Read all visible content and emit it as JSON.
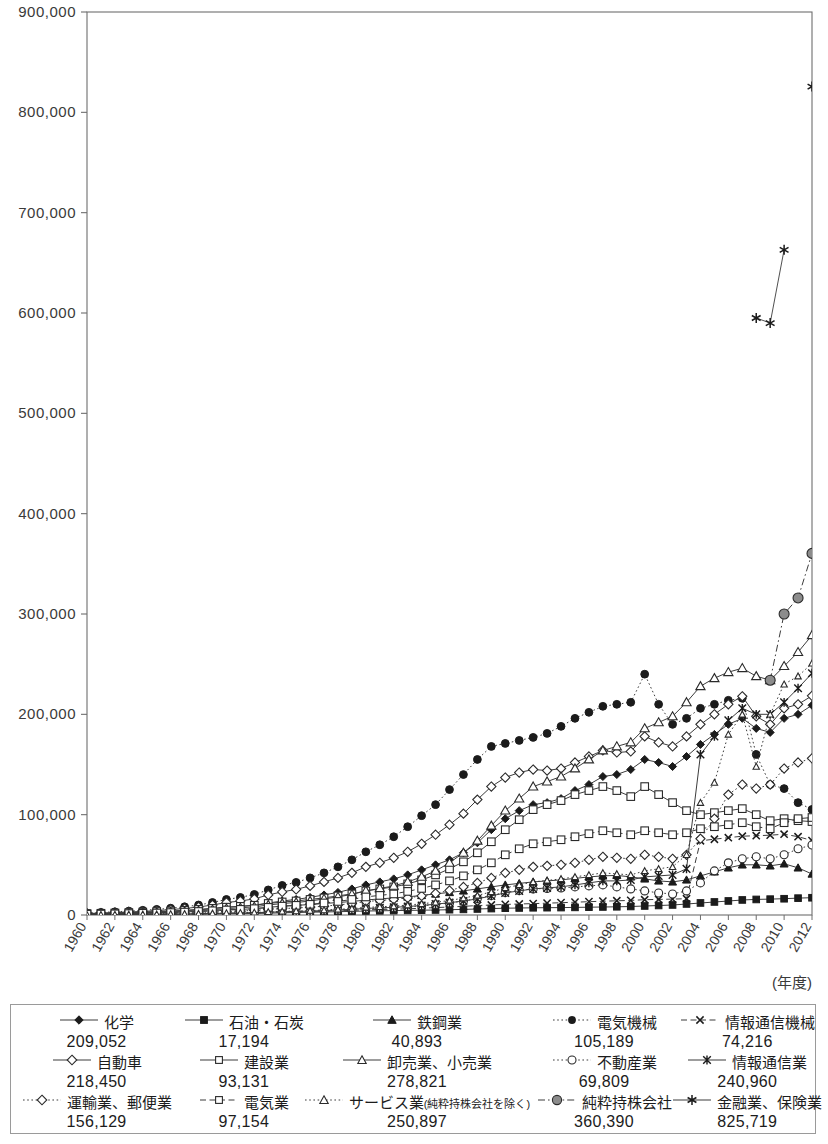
{
  "axis": {
    "x_unit_label": "(年度)",
    "y_ticks": [
      "0",
      "100,000",
      "200,000",
      "300,000",
      "400,000",
      "500,000",
      "600,000",
      "700,000",
      "800,000",
      "900,000"
    ],
    "y_min": 0,
    "y_max": 900000,
    "y_step": 100000,
    "x_ticks": [
      "1960",
      "1962",
      "1964",
      "1966",
      "1968",
      "1970",
      "1972",
      "1974",
      "1976",
      "1978",
      "1980",
      "1982",
      "1984",
      "1986",
      "1988",
      "1990",
      "1992",
      "1994",
      "1996",
      "1998",
      "2000",
      "2002",
      "2004",
      "2006",
      "2008",
      "2010",
      "2012"
    ]
  },
  "legend": {
    "rows": [
      [
        {
          "label": "化学",
          "value": "209,052",
          "key": "kagaku"
        },
        {
          "label": "石油・石炭",
          "value": "17,194",
          "key": "sekiyu"
        },
        {
          "label": "鉄鋼業",
          "value": "40,893",
          "key": "tekko"
        },
        {
          "label": "電気機械",
          "value": "105,189",
          "key": "denki_kikai"
        },
        {
          "label": "情報通信機械",
          "value": "74,216",
          "key": "joho_kikai"
        }
      ],
      [
        {
          "label": "自動車",
          "value": "218,450",
          "key": "jidosha"
        },
        {
          "label": "建設業",
          "value": "93,131",
          "key": "kensetsu"
        },
        {
          "label": "卸売業、小売業",
          "value": "278,821",
          "key": "oroshi"
        },
        {
          "label": "不動産業",
          "value": "69,809",
          "key": "fudosan"
        },
        {
          "label": "情報通信業",
          "value": "240,960",
          "key": "joho_tsushin"
        }
      ],
      [
        {
          "label": "運輸業、郵便業",
          "value": "156,129",
          "key": "unyu"
        },
        {
          "label": "電気業",
          "value": "97,154",
          "key": "denkigyo"
        },
        {
          "label": "サービス業(純粋持株会社を除く)",
          "value": "250,897",
          "key": "service"
        },
        {
          "label": "純粋持株会社",
          "value": "360,390",
          "key": "junsui"
        },
        {
          "label": "金融業、保険業",
          "value": "825,719",
          "key": "kinyu"
        }
      ]
    ]
  },
  "colors": {
    "axis": "#6e6e6e",
    "line": "#3c3c3c",
    "text": "#2c2c2c",
    "holding_fill": "#8c8c8c"
  },
  "chart_data": {
    "type": "line",
    "title": "",
    "xlabel": "(年度)",
    "ylabel": "",
    "ylim": [
      0,
      900000
    ],
    "grid": false,
    "legend_position": "bottom",
    "x": [
      1960,
      1961,
      1962,
      1963,
      1964,
      1965,
      1966,
      1967,
      1968,
      1969,
      1970,
      1971,
      1972,
      1973,
      1974,
      1975,
      1976,
      1977,
      1978,
      1979,
      1980,
      1981,
      1982,
      1983,
      1984,
      1985,
      1986,
      1987,
      1988,
      1989,
      1990,
      1991,
      1992,
      1993,
      1994,
      1995,
      1996,
      1997,
      1998,
      1999,
      2000,
      2001,
      2002,
      2003,
      2004,
      2005,
      2006,
      2007,
      2008,
      2009,
      2010,
      2011,
      2012
    ],
    "series": [
      {
        "name": "化学",
        "key": "kagaku",
        "marker": "diamond-filled",
        "dash": "solid",
        "final": 209052,
        "values": [
          1200,
          1500,
          1800,
          2200,
          2600,
          3000,
          3600,
          4300,
          5200,
          6400,
          7800,
          8600,
          9800,
          12000,
          14000,
          15500,
          17500,
          20000,
          22500,
          26000,
          30000,
          33000,
          36000,
          40000,
          45000,
          50000,
          55000,
          62000,
          72000,
          85000,
          96000,
          104000,
          110000,
          112000,
          116000,
          124000,
          130000,
          138000,
          140000,
          145000,
          155000,
          152000,
          148000,
          158000,
          170000,
          180000,
          190000,
          196000,
          186000,
          182000,
          196000,
          200000,
          209052
        ]
      },
      {
        "name": "石油・石炭",
        "key": "sekiyu",
        "marker": "square-filled",
        "dash": "solid",
        "final": 17194,
        "values": [
          300,
          350,
          400,
          450,
          500,
          600,
          700,
          800,
          900,
          1000,
          1200,
          1300,
          1500,
          1800,
          2200,
          2500,
          2800,
          3000,
          3300,
          3600,
          4000,
          4200,
          4400,
          4600,
          4800,
          5000,
          5300,
          5600,
          6000,
          6400,
          6800,
          7000,
          7200,
          7300,
          7400,
          7600,
          7800,
          8000,
          8200,
          8500,
          9000,
          9500,
          10000,
          11000,
          12000,
          13000,
          14000,
          15000,
          15500,
          15800,
          16200,
          16800,
          17194
        ]
      },
      {
        "name": "鉄鋼業",
        "key": "tekko",
        "marker": "triangle-filled",
        "dash": "solid",
        "final": 40893,
        "values": [
          900,
          1100,
          1300,
          1600,
          1900,
          2200,
          2600,
          3000,
          3600,
          4300,
          5100,
          5600,
          6300,
          7600,
          8900,
          9600,
          10500,
          11500,
          12500,
          13500,
          15000,
          16000,
          17000,
          18000,
          19500,
          21000,
          22500,
          24000,
          26000,
          28000,
          30000,
          31500,
          33000,
          34000,
          35000,
          36500,
          38000,
          39000,
          39500,
          38000,
          36000,
          34000,
          33000,
          35000,
          39000,
          43000,
          47000,
          50000,
          50000,
          49000,
          51000,
          47000,
          40893
        ]
      },
      {
        "name": "電気機械",
        "key": "denki_kikai",
        "marker": "circle-filled",
        "dash": "dotted",
        "final": 105189,
        "values": [
          2000,
          2600,
          3200,
          3900,
          4700,
          5600,
          6800,
          8200,
          10000,
          12500,
          15500,
          17500,
          20500,
          25000,
          29500,
          32500,
          37000,
          42000,
          48000,
          55000,
          63000,
          70000,
          78000,
          88000,
          99000,
          110000,
          125000,
          140000,
          155000,
          168000,
          171000,
          174000,
          177000,
          181000,
          188000,
          196000,
          202000,
          208000,
          210000,
          212000,
          240000,
          210000,
          190000,
          196000,
          206000,
          210000,
          214000,
          216000,
          160000,
          130000,
          126000,
          112000,
          105189
        ]
      },
      {
        "name": "情報通信機械",
        "key": "joho_kikai",
        "marker": "x-cross",
        "dash": "dash",
        "final": 74216,
        "values": [
          400,
          450,
          520,
          600,
          700,
          800,
          950,
          1100,
          1300,
          1500,
          1800,
          2000,
          2300,
          2700,
          3000,
          3200,
          3500,
          3800,
          4200,
          4600,
          5200,
          5500,
          5800,
          6200,
          6800,
          7400,
          8000,
          8700,
          9400,
          10000,
          10600,
          11000,
          11400,
          11800,
          12300,
          12800,
          13300,
          13800,
          14200,
          14600,
          15200,
          15500,
          15800,
          16200,
          74000,
          75500,
          77000,
          78500,
          79000,
          79500,
          80500,
          78000,
          74216
        ]
      },
      {
        "name": "自動車",
        "key": "jidosha",
        "marker": "diamond-open",
        "dash": "solid",
        "final": 218450,
        "values": [
          1500,
          1900,
          2400,
          3000,
          3600,
          4400,
          5400,
          6500,
          8000,
          10000,
          12500,
          14000,
          16000,
          20000,
          23000,
          25500,
          29000,
          33000,
          37000,
          42000,
          48000,
          52000,
          57000,
          63000,
          71000,
          80000,
          90000,
          101000,
          115000,
          128000,
          137000,
          142000,
          145000,
          144000,
          146000,
          152000,
          158000,
          164000,
          162000,
          163000,
          178000,
          172000,
          168000,
          178000,
          190000,
          200000,
          210000,
          218000,
          198000,
          190000,
          206000,
          210000,
          218450
        ]
      },
      {
        "name": "建設業",
        "key": "kensetsu",
        "marker": "square-open",
        "dash": "solid",
        "final": 93131,
        "values": [
          1400,
          1700,
          2000,
          2400,
          2900,
          3400,
          4000,
          4700,
          5600,
          6600,
          7800,
          8600,
          9700,
          11500,
          13000,
          14000,
          15500,
          17000,
          19000,
          21000,
          24000,
          26000,
          28000,
          31000,
          35000,
          40000,
          46000,
          53000,
          62000,
          73000,
          85000,
          95000,
          105000,
          110000,
          114000,
          120000,
          124000,
          128000,
          124000,
          118000,
          128000,
          120000,
          112000,
          104000,
          100000,
          102000,
          104000,
          106000,
          100000,
          94000,
          96000,
          94000,
          93131
        ]
      },
      {
        "name": "卸売業、小売業",
        "key": "oroshi",
        "marker": "triangle-open",
        "dash": "solid",
        "final": 278821,
        "values": [
          900,
          1100,
          1400,
          1700,
          2100,
          2500,
          3000,
          3600,
          4400,
          5300,
          6400,
          7200,
          8200,
          10000,
          11500,
          12500,
          14000,
          16000,
          18000,
          20500,
          24000,
          26500,
          29000,
          33000,
          38000,
          44000,
          52000,
          62000,
          74000,
          89000,
          104000,
          116000,
          128000,
          133000,
          138000,
          146000,
          155000,
          164000,
          168000,
          172000,
          186000,
          192000,
          198000,
          212000,
          228000,
          236000,
          242000,
          246000,
          238000,
          234000,
          248000,
          262000,
          278821
        ]
      },
      {
        "name": "不動産業",
        "key": "fudosan",
        "marker": "circle-open",
        "dash": "dotted",
        "final": 69809,
        "values": [
          200,
          250,
          300,
          380,
          460,
          560,
          680,
          820,
          1000,
          1200,
          1500,
          1700,
          2000,
          2500,
          2900,
          3200,
          3600,
          4100,
          4700,
          5400,
          6300,
          6800,
          7400,
          8200,
          9200,
          10500,
          12000,
          14000,
          16500,
          19500,
          22500,
          24500,
          26000,
          26500,
          27000,
          28000,
          29000,
          30000,
          28000,
          26000,
          24000,
          22000,
          21000,
          24000,
          32000,
          44000,
          52000,
          56000,
          58000,
          56000,
          60000,
          66000,
          69809
        ]
      },
      {
        "name": "情報通信業",
        "key": "joho_tsushin",
        "marker": "star-x",
        "dash": "solid",
        "final": 240960,
        "values": [
          300,
          350,
          420,
          500,
          600,
          720,
          870,
          1040,
          1250,
          1500,
          1800,
          2000,
          2300,
          2800,
          3200,
          3500,
          3900,
          4400,
          5000,
          5700,
          6600,
          7100,
          7700,
          8500,
          9500,
          10800,
          12300,
          14000,
          16000,
          19000,
          22000,
          24000,
          26000,
          27000,
          28000,
          30000,
          32000,
          34000,
          34000,
          35000,
          38000,
          39000,
          40000,
          46000,
          160000,
          178000,
          194000,
          206000,
          200000,
          200000,
          212000,
          226000,
          240960
        ]
      },
      {
        "name": "運輸業、郵便業",
        "key": "unyu",
        "marker": "diamond-open",
        "dash": "dotted",
        "final": 156129,
        "values": [
          600,
          700,
          850,
          1000,
          1200,
          1450,
          1750,
          2100,
          2500,
          3000,
          3600,
          4000,
          4600,
          5600,
          6400,
          7000,
          7800,
          8800,
          10000,
          11500,
          13500,
          14500,
          15600,
          17000,
          19000,
          21500,
          24500,
          28000,
          32000,
          37000,
          42000,
          45000,
          48000,
          49000,
          50000,
          52000,
          55000,
          58000,
          57000,
          56000,
          60000,
          58000,
          56000,
          60000,
          76000,
          96000,
          120000,
          130000,
          126000,
          130000,
          146000,
          152000,
          156129
        ]
      },
      {
        "name": "電気業",
        "key": "denkigyo",
        "marker": "square-open",
        "dash": "dash",
        "final": 97154,
        "values": [
          800,
          950,
          1150,
          1400,
          1700,
          2000,
          2400,
          2900,
          3500,
          4200,
          5000,
          5600,
          6300,
          7600,
          8800,
          9600,
          10600,
          12000,
          13500,
          15500,
          18000,
          19500,
          21000,
          23500,
          26500,
          30000,
          34000,
          39000,
          45000,
          52000,
          60000,
          66000,
          71000,
          73000,
          75000,
          78000,
          81000,
          84000,
          82000,
          80000,
          84000,
          82000,
          80000,
          82000,
          86000,
          88000,
          90000,
          92000,
          88000,
          86000,
          92000,
          96000,
          97154
        ]
      },
      {
        "name": "サービス業(純粋持株会社を除く)",
        "key": "service",
        "marker": "triangle-open-small",
        "dash": "dotted",
        "final": 250897,
        "values": [
          300,
          370,
          450,
          550,
          670,
          800,
          970,
          1160,
          1400,
          1680,
          2000,
          2250,
          2600,
          3100,
          3600,
          3950,
          4400,
          5000,
          5700,
          6500,
          7600,
          8200,
          8900,
          9900,
          11200,
          12700,
          14500,
          16800,
          19500,
          23000,
          27000,
          30000,
          33000,
          34500,
          36000,
          38000,
          40000,
          42000,
          41000,
          40000,
          44000,
          46000,
          48000,
          60000,
          112000,
          132000,
          180000,
          200000,
          148000,
          200000,
          230000,
          238000,
          250897
        ]
      },
      {
        "name": "純粋持株会社",
        "key": "junsui",
        "marker": "circle-gray",
        "dash": "dashdot",
        "final": 360390,
        "values": [
          null,
          null,
          null,
          null,
          null,
          null,
          null,
          null,
          null,
          null,
          null,
          null,
          null,
          null,
          null,
          null,
          null,
          null,
          null,
          null,
          null,
          null,
          null,
          null,
          null,
          null,
          null,
          null,
          null,
          null,
          null,
          null,
          null,
          null,
          null,
          null,
          null,
          null,
          null,
          null,
          null,
          null,
          null,
          null,
          null,
          null,
          null,
          null,
          null,
          234000,
          300000,
          316000,
          360390
        ]
      },
      {
        "name": "金融業、保険業",
        "key": "kinyu",
        "marker": "asterisk",
        "dash": "solid",
        "final": 825719,
        "values": [
          null,
          null,
          null,
          null,
          null,
          null,
          null,
          null,
          null,
          null,
          null,
          null,
          null,
          null,
          null,
          null,
          null,
          null,
          null,
          null,
          null,
          null,
          null,
          null,
          null,
          null,
          null,
          null,
          null,
          null,
          null,
          null,
          null,
          null,
          null,
          null,
          null,
          null,
          null,
          null,
          null,
          null,
          null,
          null,
          null,
          null,
          null,
          null,
          595000,
          590000,
          663000,
          null,
          825719
        ]
      }
    ]
  }
}
